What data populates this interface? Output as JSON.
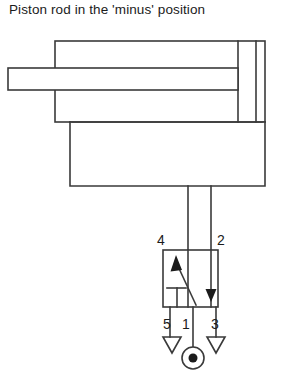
{
  "title": "Piston rod in the 'minus' position",
  "diagram": {
    "type": "pneumatic-circuit",
    "stroke_color": "#3a3a3a",
    "fill_color": "#ffffff",
    "background": "#ffffff",
    "components": {
      "cylinder": {
        "name": "double-acting-cylinder",
        "body": {
          "x": 55,
          "y": 41,
          "width": 210,
          "height": 81
        },
        "end_cap_line_1": 238,
        "end_cap_line_2": 256,
        "end_cap_line_3": 265,
        "rod": {
          "x": 8,
          "y": 68,
          "width": 230,
          "height": 22
        },
        "base": {
          "x": 70,
          "y": 122,
          "width": 195,
          "height": 64
        }
      },
      "pipes": {
        "left_pipe_x": 188,
        "right_pipe_x": 211,
        "pipe_top_y": 186,
        "pipe_bottom_y": 250
      },
      "valve": {
        "name": "five-two-way-valve",
        "box": {
          "x": 163,
          "y": 250,
          "width": 55,
          "height": 57
        },
        "symbol": "cross-over-flow-with-blocked-port"
      },
      "supply": {
        "name": "compressed-air-source",
        "circle": {
          "cx": 193,
          "cy": 358,
          "r": 11
        },
        "dot_radius": 4.5
      },
      "exhausts": [
        {
          "name": "exhaust-port-5",
          "x": 170
        },
        {
          "name": "exhaust-port-3",
          "x": 216
        }
      ]
    },
    "port_labels": {
      "top_left": "4",
      "top_right": "2",
      "bottom_left": "5",
      "bottom_center": "1",
      "bottom_right": "3"
    },
    "port_label_positions": {
      "four": {
        "x": 161,
        "y": 245
      },
      "two": {
        "x": 209,
        "y": 245
      },
      "five": {
        "x": 162,
        "y": 329
      },
      "one": {
        "x": 180,
        "y": 329
      },
      "three": {
        "x": 210,
        "y": 329
      }
    }
  }
}
